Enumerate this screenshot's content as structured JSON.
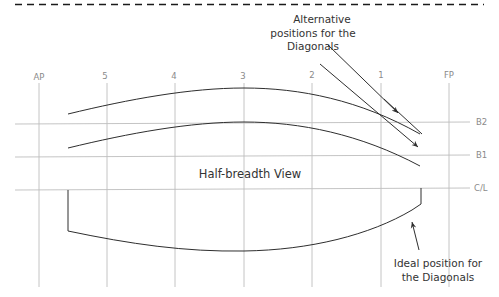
{
  "diagram": {
    "title": "Half-breadth View",
    "colors": {
      "grid": "#bdbdbd",
      "curve": "#2e2e2e",
      "dashed_border": "#1a1a1a",
      "label": "#8a8a8a",
      "annotation": "#333333"
    },
    "stations": [
      {
        "label": "AP",
        "x": 39
      },
      {
        "label": "5",
        "x": 107
      },
      {
        "label": "4",
        "x": 175
      },
      {
        "label": "3",
        "x": 244
      },
      {
        "label": "2",
        "x": 312
      },
      {
        "label": "1",
        "x": 381
      },
      {
        "label": "FP",
        "x": 449
      }
    ],
    "buttock_lines": [
      {
        "label": "B2",
        "y": 123
      },
      {
        "label": "B1",
        "y": 156
      },
      {
        "label": "C/L",
        "y": 189
      }
    ],
    "annotations": {
      "alternative": [
        "Alternative",
        "positions for the",
        "Diagonals"
      ],
      "ideal": [
        "Ideal position for",
        "the Diagonals"
      ]
    }
  }
}
